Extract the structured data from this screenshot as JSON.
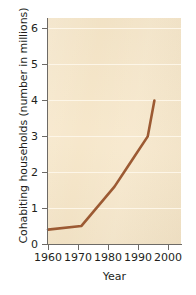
{
  "chart_data": {
    "type": "line",
    "title": "",
    "xlabel": "Year",
    "ylabel": "Cohabiting households (number in millions)",
    "xlim": [
      1960,
      2000
    ],
    "ylim": [
      0,
      6.3
    ],
    "xticks": [
      1960,
      1970,
      1980,
      1990,
      2000
    ],
    "yticks": [
      0,
      1,
      2,
      3,
      4,
      5,
      6
    ],
    "grid": "horizontal",
    "legend": "none",
    "plot_background": "#f6e6c8",
    "gridline_color": "#fdf6e8",
    "series": [
      {
        "name": "Cohabiting households",
        "color": "#9c5a33",
        "x": [
          1960,
          1970,
          1980,
          1985,
          1990,
          1992
        ],
        "values": [
          0.4,
          0.5,
          1.6,
          2.3,
          3.0,
          4.0
        ]
      }
    ]
  },
  "axes": {
    "y": {
      "title": "Cohabiting households (number in millions)",
      "tick_labels": [
        "6",
        "5",
        "4",
        "3",
        "2",
        "1",
        "0"
      ]
    },
    "x": {
      "title": "Year",
      "tick_labels": [
        "1960",
        "1970",
        "1980",
        "1990",
        "2000"
      ]
    }
  }
}
